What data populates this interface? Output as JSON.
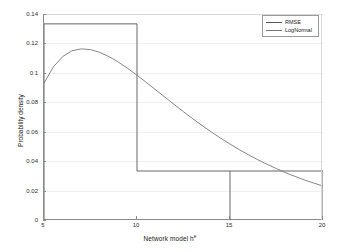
{
  "chart_data": {
    "type": "bar",
    "title": "",
    "subtitle": "",
    "xlabel": "Network model h",
    "xlabel_superscript": "e",
    "ylabel": "Probability density",
    "xlim": [
      5,
      20
    ],
    "ylim": [
      0,
      0.14
    ],
    "grid": true,
    "xticks": [
      5,
      10,
      15,
      20
    ],
    "xticklabels": [
      "5",
      "10",
      "15",
      "20"
    ],
    "yticks": [
      0,
      0.02,
      0.04,
      0.06,
      0.08,
      0.1,
      0.12,
      0.14
    ],
    "yticklabels": [
      "0",
      "0.02",
      "0.04",
      "0.06",
      "0.08",
      "0.1",
      "0.12",
      "0.14"
    ],
    "legend_position": "top-right",
    "series": [
      {
        "name": "RMSE",
        "type": "histogram",
        "color": "#555555",
        "bin_edges": [
          5,
          10,
          15,
          20
        ],
        "values": [
          0.1333,
          0.0333,
          0.0333
        ]
      },
      {
        "name": "LogNormal",
        "type": "line",
        "color": "#777777",
        "x": [
          5,
          5.5,
          6,
          6.5,
          7,
          7.5,
          8,
          8.5,
          9,
          9.5,
          10,
          10.5,
          11,
          11.5,
          12,
          12.5,
          13,
          13.5,
          14,
          14.5,
          15,
          15.5,
          16,
          16.5,
          17,
          17.5,
          18,
          18.5,
          19,
          19.5,
          20
        ],
        "y": [
          0.093,
          0.104,
          0.111,
          0.115,
          0.1163,
          0.1158,
          0.1139,
          0.111,
          0.1073,
          0.103,
          0.0984,
          0.0935,
          0.0885,
          0.0835,
          0.0785,
          0.0736,
          0.0688,
          0.0642,
          0.0598,
          0.0556,
          0.0516,
          0.0478,
          0.0443,
          0.0409,
          0.0378,
          0.0349,
          0.0321,
          0.0296,
          0.0272,
          0.0251,
          0.0231
        ]
      }
    ]
  },
  "legend": {
    "items": [
      {
        "label": "RMSE"
      },
      {
        "label": "LogNormal"
      }
    ]
  }
}
